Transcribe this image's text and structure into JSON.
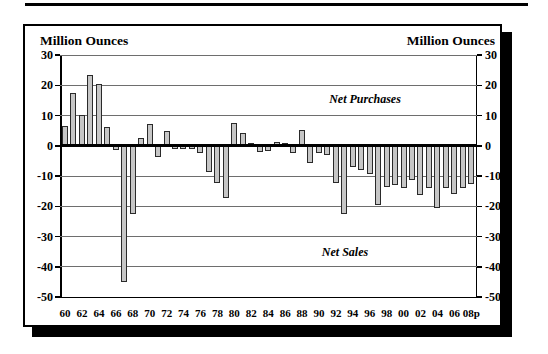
{
  "chart": {
    "colors": {
      "bar_fill": "#c6c6c6",
      "bar_border": "#2a2a2a",
      "grid": "#6e6e6e",
      "axis": "#000000",
      "frame_shadow": "#000000"
    }
  },
  "chart_data": {
    "type": "bar",
    "title": "",
    "ylabel_left": "Million Ounces",
    "ylabel_right": "Million Ounces",
    "ylim": [
      -50,
      30
    ],
    "ytick_interval": 10,
    "yticks": [
      30,
      20,
      10,
      0,
      -10,
      -20,
      -30,
      -40,
      -50
    ],
    "grid": true,
    "xtick_labels": [
      "60",
      "62",
      "64",
      "66",
      "68",
      "70",
      "72",
      "74",
      "76",
      "78",
      "80",
      "82",
      "84",
      "86",
      "88",
      "90",
      "92",
      "94",
      "96",
      "98",
      "00",
      "02",
      "04",
      "06",
      "08p"
    ],
    "years": [
      1960,
      1961,
      1962,
      1963,
      1964,
      1965,
      1966,
      1967,
      1968,
      1969,
      1970,
      1971,
      1972,
      1973,
      1974,
      1975,
      1976,
      1977,
      1978,
      1979,
      1980,
      1981,
      1982,
      1983,
      1984,
      1985,
      1986,
      1987,
      1988,
      1989,
      1990,
      1991,
      1992,
      1993,
      1994,
      1995,
      1996,
      1997,
      1998,
      1999,
      2000,
      2001,
      2002,
      2003,
      2004,
      2005,
      2006,
      2007,
      2008
    ],
    "values": [
      6.5,
      17.3,
      10.2,
      23.4,
      20.3,
      6.3,
      -1.5,
      -45.0,
      -22.6,
      2.5,
      7.3,
      -3.6,
      4.8,
      -1.0,
      -1.2,
      -1.2,
      -2.5,
      -8.8,
      -12.2,
      -17.4,
      7.4,
      4.2,
      1.0,
      -2.0,
      -1.8,
      1.2,
      0.8,
      -2.5,
      5.2,
      -5.8,
      -2.3,
      -3.2,
      -12.3,
      -22.5,
      -7.0,
      -8.0,
      -9.2,
      -19.5,
      -13.5,
      -13.0,
      -14.0,
      -11.4,
      -16.4,
      -14.0,
      -20.5,
      -14.0,
      -15.8,
      -14.0,
      -12.8
    ],
    "annotations": [
      {
        "text": "Net Purchases",
        "region": "positive"
      },
      {
        "text": "Net Sales",
        "region": "negative"
      }
    ]
  }
}
